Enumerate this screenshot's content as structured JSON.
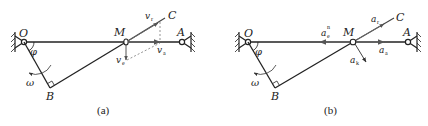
{
  "figures": [
    {
      "id": "a",
      "caption": "(a)",
      "points": {
        "O": "O",
        "A": "A",
        "M": "M",
        "B": "B",
        "C": "C"
      },
      "angle_label": "φ",
      "angular_velocity_label": "ω",
      "vectors": [
        {
          "name": "v_r",
          "symbol": "v",
          "sub": "r"
        },
        {
          "name": "v_e",
          "symbol": "v",
          "sub": "e"
        },
        {
          "name": "v_a",
          "symbol": "v",
          "sub": "a"
        }
      ]
    },
    {
      "id": "b",
      "caption": "(b)",
      "points": {
        "O": "O",
        "A": "A",
        "M": "M",
        "B": "B",
        "C": "C"
      },
      "angle_label": "φ",
      "angular_velocity_label": "ω",
      "vectors": [
        {
          "name": "a_r",
          "symbol": "a",
          "sub": "r"
        },
        {
          "name": "a_e_n",
          "symbol": "a",
          "sub": "e",
          "sup": "n"
        },
        {
          "name": "a_a",
          "symbol": "a",
          "sub": "a"
        },
        {
          "name": "a_k",
          "symbol": "a",
          "sub": "k"
        }
      ]
    }
  ]
}
